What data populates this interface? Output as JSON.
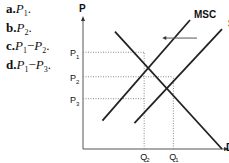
{
  "options": [
    {
      "letter": "a.",
      "expr": [
        {
          "v": "P",
          "sub": "1"
        }
      ],
      "suffix": "."
    },
    {
      "letter": "b.",
      "expr": [
        {
          "v": "P",
          "sub": "2"
        }
      ],
      "suffix": "."
    },
    {
      "letter": "c.",
      "expr": [
        {
          "v": "P",
          "sub": "1"
        },
        {
          "op": "−"
        },
        {
          "v": "P",
          "sub": "2"
        }
      ],
      "suffix": "."
    },
    {
      "letter": "d.",
      "expr": [
        {
          "v": "P",
          "sub": "1"
        },
        {
          "op": "−"
        },
        {
          "v": "P",
          "sub": "3"
        }
      ],
      "suffix": "."
    }
  ],
  "chart_data": {
    "type": "line",
    "title": "",
    "xlabel": "",
    "ylabel": "P",
    "x_ticks": [
      {
        "label": "Q",
        "sub": "2",
        "x": 0.44
      },
      {
        "label": "Q",
        "sub": "1",
        "x": 0.65
      }
    ],
    "y_ticks": [
      {
        "label": "P",
        "sub": "1",
        "y": 0.75
      },
      {
        "label": "P",
        "sub": "2",
        "y": 0.56
      },
      {
        "label": "P",
        "sub": "3",
        "y": 0.39
      }
    ],
    "xlim": [
      0,
      1
    ],
    "ylim": [
      0,
      1
    ],
    "series": [
      {
        "name": "MSC",
        "points": [
          [
            0.14,
            0.22
          ],
          [
            0.77,
            1.0
          ]
        ]
      },
      {
        "name": "S",
        "points": [
          [
            0.37,
            0.2
          ],
          [
            1.0,
            0.93
          ]
        ]
      },
      {
        "name": "D",
        "points": [
          [
            0.23,
            0.91
          ],
          [
            1.0,
            0.0
          ]
        ]
      }
    ],
    "annotations": [
      {
        "type": "arrow",
        "from": [
          0.82,
          0.86
        ],
        "to": [
          0.57,
          0.86
        ],
        "meaning": "supply shifts left to MSC"
      }
    ],
    "guides": "dotted lines from P1,P2,P3 and Q2,Q1 to intersections"
  }
}
